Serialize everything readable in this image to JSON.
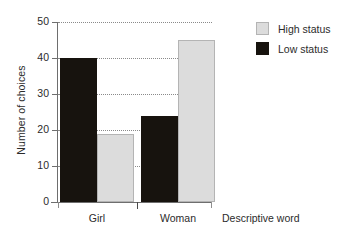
{
  "chart_data": {
    "type": "bar",
    "title": "",
    "subtitle": "",
    "xlabel": "Descriptive word",
    "ylabel": "Number of choices",
    "categories": [
      "Girl",
      "Woman"
    ],
    "series": [
      {
        "name": "High status",
        "color": "#dcdcdc",
        "values": [
          19,
          45
        ]
      },
      {
        "name": "Low status",
        "color": "#17130e",
        "values": [
          40,
          24
        ]
      }
    ],
    "bar_order_within_group": [
      "Low status",
      "High status"
    ],
    "ylim": [
      0,
      50
    ],
    "ytick_labels": [
      "0",
      "10",
      "20",
      "30",
      "40",
      "50"
    ],
    "ytick_values": [
      0,
      10,
      20,
      30,
      40,
      50
    ],
    "grid": "horizontal-dotted",
    "legend_position": "right-top",
    "annotations": []
  },
  "legend": {
    "items": [
      {
        "label": "High status",
        "swatch": "high-status-swatch"
      },
      {
        "label": "Low status",
        "swatch": "low-status-swatch"
      }
    ]
  }
}
